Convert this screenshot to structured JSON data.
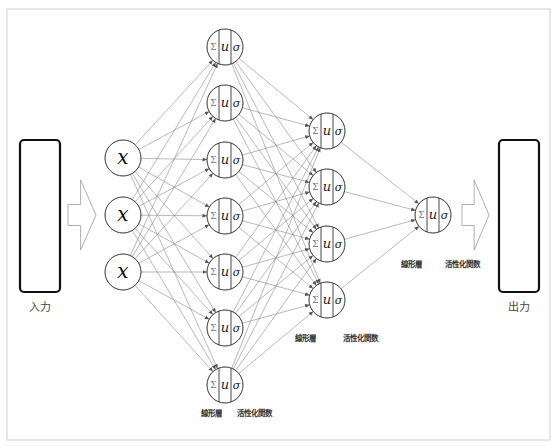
{
  "diagram": {
    "title": "",
    "input_box": {
      "label": "入力",
      "x": 20,
      "y": 140,
      "w": 40,
      "h": 152
    },
    "output_box": {
      "label": "出力",
      "x": 499,
      "y": 140,
      "w": 40,
      "h": 152
    },
    "arrows": [
      {
        "name": "input-arrow",
        "x": 68,
        "y": 215,
        "w": 28,
        "h": 70
      },
      {
        "name": "output-arrow",
        "x": 462,
        "y": 215,
        "w": 27,
        "h": 70
      }
    ],
    "node_symbols": {
      "sum": "Σ",
      "u": "u",
      "sigma": "σ",
      "input": "x"
    },
    "layers": [
      {
        "name": "input-layer",
        "type": "input",
        "x": 123,
        "r": 18,
        "ys": [
          158,
          215,
          272
        ]
      },
      {
        "name": "hidden-layer-1",
        "type": "neuron",
        "x": 225,
        "r": 18,
        "ys": [
          47,
          103,
          160,
          216,
          272,
          328,
          385
        ],
        "labels": {
          "linear": "線形層",
          "activation": "活性化関数",
          "y": 416,
          "linear_x": 211,
          "activation_x": 254
        }
      },
      {
        "name": "hidden-layer-2",
        "type": "neuron",
        "x": 327,
        "r": 18,
        "ys": [
          131,
          187,
          244,
          300
        ],
        "labels": {
          "linear": "線形層",
          "activation": "活性化関数",
          "y": 341,
          "linear_x": 305,
          "activation_x": 360
        }
      },
      {
        "name": "output-layer",
        "type": "neuron",
        "x": 433,
        "r": 18,
        "ys": [
          215
        ],
        "labels": {
          "linear": "線形層",
          "activation": "活性化関数",
          "y": 267,
          "linear_x": 411,
          "activation_x": 462
        }
      }
    ],
    "colors": {
      "edge": "#8a8a8a",
      "node_stroke": "#333333",
      "box_stroke": "#111111",
      "frame": "#d8d8d8"
    }
  }
}
